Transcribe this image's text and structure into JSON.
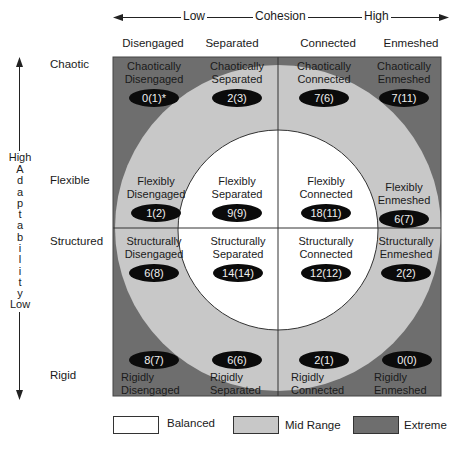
{
  "axes": {
    "cohesion": {
      "low_label": "Low",
      "title": "Cohesion",
      "high_label": "High"
    },
    "adaptability": {
      "high_label": "High",
      "title": "Adaptability",
      "letters": [
        "A",
        "d",
        "a",
        "p",
        "t",
        "a",
        "b",
        "i",
        "l",
        "i",
        "t",
        "y"
      ],
      "low_label": "Low"
    }
  },
  "columns": [
    "Disengaged",
    "Separated",
    "Connected",
    "Enmeshed"
  ],
  "rows": [
    "Chaotic",
    "Flexible",
    "Structured",
    "Rigid"
  ],
  "cells": {
    "chaotic": [
      {
        "line1": "Chaotically",
        "line2": "Disengaged",
        "value": "0(1)*"
      },
      {
        "line1": "Chaotically",
        "line2": "Separated",
        "value": "2(3)"
      },
      {
        "line1": "Chaotically",
        "line2": "Connected",
        "value": "7(6)"
      },
      {
        "line1": "Chaotically",
        "line2": "Enmeshed",
        "value": "7(11)"
      }
    ],
    "flexible": [
      {
        "line1": "Flexibly",
        "line2": "Disengaged",
        "value": "1(2)"
      },
      {
        "line1": "Flexibly",
        "line2": "Separated",
        "value": "9(9)"
      },
      {
        "line1": "Flexibly",
        "line2": "Connected",
        "value": "18(11)"
      },
      {
        "line1": "Flexibly",
        "line2": "Enmeshed",
        "value": "6(7)"
      }
    ],
    "structured": [
      {
        "line1": "Structurally",
        "line2": "Disengaged",
        "value": "6(8)"
      },
      {
        "line1": "Structurally",
        "line2": "Separated",
        "value": "14(14)"
      },
      {
        "line1": "Structurally",
        "line2": "Connected",
        "value": "12(12)"
      },
      {
        "line1": "Structurally",
        "line2": "Enmeshed",
        "value": "2(2)"
      }
    ],
    "rigid": [
      {
        "line1": "Rigidly",
        "line2": "Disengaged",
        "value": "8(7)"
      },
      {
        "line1": "Rigidly",
        "line2": "Separated",
        "value": "6(6)"
      },
      {
        "line1": "Rigidly",
        "line2": "Connected",
        "value": "2(1)"
      },
      {
        "line1": "Rigidly",
        "line2": "Enmeshed",
        "value": "0(0)"
      }
    ]
  },
  "legend": [
    {
      "label": "Balanced",
      "color": "#ffffff"
    },
    {
      "label": "Mid Range",
      "color": "#c8c8c8"
    },
    {
      "label": "Extreme",
      "color": "#6e6e6e"
    }
  ],
  "colors": {
    "extreme": "#6e6e6e",
    "mid_range": "#c8c8c8",
    "balanced": "#ffffff",
    "pill": "#0b0b0b"
  }
}
